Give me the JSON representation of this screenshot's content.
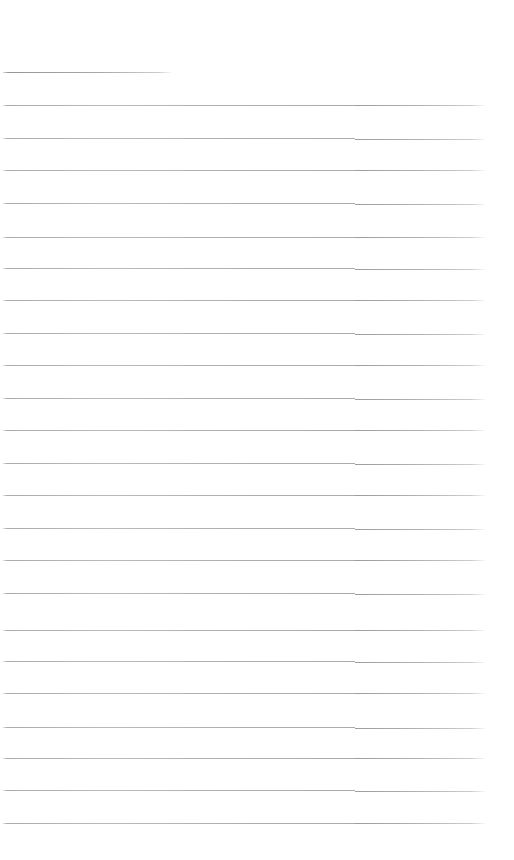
{
  "page": {
    "kind": "scanned-ruled-paper",
    "width": 514,
    "height": 860,
    "background_color": "#ffffff",
    "text_content": "",
    "has_handwriting": false,
    "has_printed_text": false
  },
  "ruling": {
    "line_color": "#9a9a9a",
    "line_thickness_px": 1,
    "line_spacing_px": 32.4,
    "line_count": 24,
    "margin_left_px": 3,
    "margin_right_px": 486,
    "top_margin_px": 72,
    "bottom_margin_px": 37,
    "stitch_artifact_x_px": 355,
    "lines": [
      {
        "y": 72,
        "x_start": 3,
        "x_end": 172,
        "short": true
      },
      {
        "y": 105,
        "x_start": 3,
        "x_end": 486,
        "short": false
      },
      {
        "y": 138,
        "x_start": 3,
        "x_end": 486,
        "short": false
      },
      {
        "y": 170,
        "x_start": 3,
        "x_end": 486,
        "short": false
      },
      {
        "y": 203,
        "x_start": 3,
        "x_end": 486,
        "short": false
      },
      {
        "y": 237,
        "x_start": 3,
        "x_end": 486,
        "short": false
      },
      {
        "y": 268,
        "x_start": 3,
        "x_end": 486,
        "short": false
      },
      {
        "y": 300,
        "x_start": 3,
        "x_end": 486,
        "short": false
      },
      {
        "y": 333,
        "x_start": 3,
        "x_end": 486,
        "short": false
      },
      {
        "y": 365,
        "x_start": 3,
        "x_end": 486,
        "short": false
      },
      {
        "y": 398,
        "x_start": 3,
        "x_end": 486,
        "short": false
      },
      {
        "y": 430,
        "x_start": 3,
        "x_end": 486,
        "short": false
      },
      {
        "y": 463,
        "x_start": 3,
        "x_end": 486,
        "short": false
      },
      {
        "y": 495,
        "x_start": 3,
        "x_end": 486,
        "short": false
      },
      {
        "y": 528,
        "x_start": 3,
        "x_end": 486,
        "short": false
      },
      {
        "y": 560,
        "x_start": 3,
        "x_end": 486,
        "short": false
      },
      {
        "y": 593,
        "x_start": 3,
        "x_end": 486,
        "short": false
      },
      {
        "y": 630,
        "x_start": 3,
        "x_end": 486,
        "short": false
      },
      {
        "y": 661,
        "x_start": 3,
        "x_end": 486,
        "short": false
      },
      {
        "y": 693,
        "x_start": 3,
        "x_end": 486,
        "short": false
      },
      {
        "y": 727,
        "x_start": 3,
        "x_end": 486,
        "short": false
      },
      {
        "y": 758,
        "x_start": 3,
        "x_end": 486,
        "short": false
      },
      {
        "y": 790,
        "x_start": 3,
        "x_end": 486,
        "short": false
      },
      {
        "y": 823,
        "x_start": 3,
        "x_end": 486,
        "short": false
      }
    ]
  }
}
